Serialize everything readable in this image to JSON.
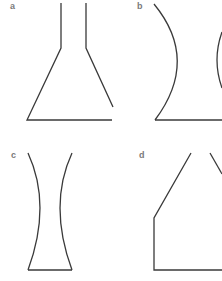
{
  "figure": {
    "panels": [
      {
        "id": "a",
        "label": "a",
        "shape": "flask-with-narrow-neck"
      },
      {
        "id": "b",
        "label": "b",
        "shape": "concave-sided-vessel"
      },
      {
        "id": "c",
        "label": "c",
        "shape": "hourglass-tapered-vessel"
      },
      {
        "id": "d",
        "label": "d",
        "shape": "angled-shoulder-vessel"
      }
    ],
    "colors": {
      "line": "#3a3a3a",
      "label": "#7a7a7a",
      "background": "#ffffff"
    }
  }
}
